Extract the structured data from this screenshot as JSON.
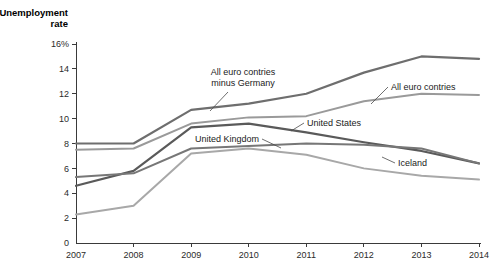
{
  "chart_data": {
    "type": "line",
    "title": "",
    "xlabel": "",
    "ylabel": "Unemployment rate",
    "ylabel_suffix": "%",
    "x": [
      2007,
      2008,
      2009,
      2010,
      2011,
      2012,
      2013,
      2014
    ],
    "xlim": [
      2007,
      2014
    ],
    "ylim": [
      0,
      16
    ],
    "y_ticks": [
      "0",
      "2",
      "4",
      "6",
      "8",
      "10",
      "12",
      "14",
      "16%"
    ],
    "y_tick_values": [
      0,
      2,
      4,
      6,
      8,
      10,
      12,
      14,
      16
    ],
    "x_ticks": [
      "2007",
      "2008",
      "2009",
      "2010",
      "2011",
      "2012",
      "2013",
      "2014"
    ],
    "grid": false,
    "legend": "inline-annotations",
    "series": [
      {
        "name": "All euro contries minus Germany",
        "color": "#6e6e6e",
        "width": 2.2,
        "values": [
          8.0,
          8.0,
          10.7,
          11.2,
          12.0,
          13.7,
          15.0,
          14.8
        ],
        "label": {
          "text_lines": [
            "All euro contries",
            "minus Germany"
          ],
          "x": 243,
          "y": 75,
          "anchor": "middle",
          "leader": "M 228 92 L 210 111"
        }
      },
      {
        "name": "All euro contries",
        "color": "#9a9a9a",
        "width": 2.0,
        "values": [
          7.5,
          7.6,
          9.6,
          10.1,
          10.2,
          11.4,
          12.0,
          11.9
        ],
        "label": {
          "text_lines": [
            "All euro contries"
          ],
          "x": 391,
          "y": 90,
          "anchor": "start",
          "leader": "M 388 87 L 371 104"
        }
      },
      {
        "name": "United States",
        "color": "#5a5a5a",
        "width": 2.2,
        "values": [
          4.6,
          5.8,
          9.3,
          9.6,
          8.9,
          8.1,
          7.4,
          6.4
        ],
        "label": {
          "text_lines": [
            "United States"
          ],
          "x": 307,
          "y": 126,
          "anchor": "start",
          "leader": "M 304 123 L 291 131"
        }
      },
      {
        "name": "United Kingdom",
        "color": "#777777",
        "width": 2.0,
        "values": [
          5.3,
          5.6,
          7.6,
          7.8,
          8.0,
          7.9,
          7.6,
          6.4
        ],
        "label": {
          "text_lines": [
            "United Kingdom"
          ],
          "x": 259,
          "y": 142,
          "anchor": "end",
          "leader": "M 262 139 L 281 148"
        }
      },
      {
        "name": "Iceland",
        "color": "#a8a8a8",
        "width": 2.0,
        "values": [
          2.3,
          3.0,
          7.2,
          7.6,
          7.1,
          6.0,
          5.4,
          5.1
        ],
        "label": {
          "text_lines": [
            "Iceland"
          ],
          "x": 398,
          "y": 166,
          "anchor": "start",
          "leader": "M 395 163 L 382 157"
        }
      }
    ]
  },
  "plot": {
    "left": 76,
    "right": 479,
    "top": 44,
    "bottom": 243
  }
}
